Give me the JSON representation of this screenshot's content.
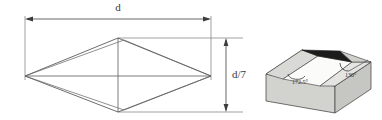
{
  "figure": {
    "left_diagram": {
      "name": "rhombus-plan-view",
      "width_dimension_label": "d",
      "height_dimension_label": "d/7",
      "shape": "rhombus with diagonals",
      "line_color": "#595959"
    },
    "right_diagram": {
      "name": "hip-roof-block",
      "angles": [
        {
          "id": "ridge-angle",
          "label": "172.5°"
        },
        {
          "id": "hip-angle",
          "label": "130°"
        }
      ],
      "face_colors": {
        "front": "#d2d2ce",
        "side": "#c6c6c2",
        "top_left_slope": "#dcdcd8",
        "top_right_slope": "#e4e4e0",
        "ridge_dark": "#1c1c1c",
        "inner": "#fbfbf9"
      },
      "outline_color": "#4d4d4d"
    }
  }
}
